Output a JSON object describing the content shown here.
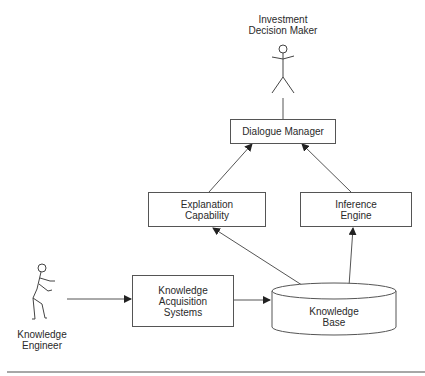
{
  "diagram": {
    "type": "architecture",
    "actors": {
      "decision_maker": {
        "line1": "Investment",
        "line2": "Decision  Maker"
      },
      "engineer": {
        "line1": "Knowledge",
        "line2": "Engineer"
      }
    },
    "components": {
      "dialogue_manager": {
        "line1": "Dialogue  Manager"
      },
      "explanation": {
        "line1": "Explanation",
        "line2": "Capability"
      },
      "inference": {
        "line1": "Inference",
        "line2": "Engine"
      },
      "acquisition": {
        "line1": "Knowledge",
        "line2": "Acquisition",
        "line3": "Systems"
      },
      "knowledge_base": {
        "line1": "Knowledge",
        "line2": "Base"
      }
    },
    "edges": [
      {
        "from": "Investment Decision Maker",
        "to": "Dialogue Manager",
        "style": "line"
      },
      {
        "from": "Explanation Capability",
        "to": "Dialogue Manager",
        "style": "arrow"
      },
      {
        "from": "Inference Engine",
        "to": "Dialogue Manager",
        "style": "arrow"
      },
      {
        "from": "Knowledge Base",
        "to": "Explanation Capability",
        "style": "arrow"
      },
      {
        "from": "Knowledge Base",
        "to": "Inference Engine",
        "style": "arrow"
      },
      {
        "from": "Knowledge Engineer",
        "to": "Knowledge Acquisition Systems",
        "style": "arrow"
      },
      {
        "from": "Knowledge Acquisition Systems",
        "to": "Knowledge Base",
        "style": "arrow"
      }
    ],
    "colors": {
      "stroke": "#555555",
      "text": "#2a2a2a",
      "background": "#ffffff",
      "rule": "#8a8a8a"
    }
  }
}
